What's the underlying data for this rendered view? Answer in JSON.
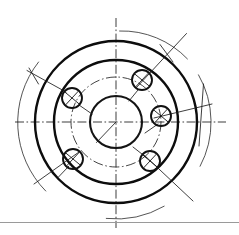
{
  "drawing": {
    "title": "Flange bolt-circle engineering drawing",
    "type": "orthographic-front-view",
    "background_color": "#ffffff",
    "line_color": "#111111",
    "thin_line_color": "#2a2a2a",
    "border_rule_color": "#9a9a9a",
    "canvas": {
      "width": 239,
      "height": 235
    },
    "center": {
      "x": 116,
      "y": 122
    },
    "features": {
      "outer_circle": {
        "name": "outer-rim-circle",
        "radius": 81,
        "line_weight": "thick"
      },
      "inner_circle": {
        "name": "inner-body-circle",
        "radius": 62,
        "line_weight": "thick"
      },
      "center_bore": {
        "name": "center-bore-circle",
        "radius": 26,
        "line_weight": "medium"
      },
      "bolt_circle": {
        "name": "bolt-circle",
        "radius": 45,
        "line_style": "dash-dot"
      },
      "hole_radius": 10,
      "hole_count": 5,
      "holes": [
        {
          "name": "hole-top",
          "angle_deg": -68,
          "cx": 142,
          "cy": 80
        },
        {
          "name": "hole-right",
          "angle_deg": -8,
          "cx": 161,
          "cy": 116
        },
        {
          "name": "hole-lower-right",
          "angle_deg": 58,
          "cx": 150,
          "cy": 161
        },
        {
          "name": "hole-lower-left",
          "angle_deg": 124,
          "cx": 73,
          "cy": 159
        },
        {
          "name": "hole-left",
          "angle_deg": 188,
          "cx": 72,
          "cy": 98
        }
      ],
      "center_lines": {
        "horizontal": {
          "name": "horizontal-center-line",
          "x1": 15,
          "x2": 226,
          "y": 122
        },
        "vertical": {
          "name": "vertical-center-line",
          "y1": 18,
          "y2": 228,
          "x": 116
        }
      },
      "dimension_arcs": [
        {
          "name": "dimension-arc-left",
          "radius": 98,
          "start_deg": 142,
          "end_deg": 225
        },
        {
          "name": "dimension-arc-top",
          "radius": 91,
          "start_deg": 272,
          "end_deg": 322
        },
        {
          "name": "dimension-arc-right",
          "radius": 95,
          "start_deg": 330,
          "end_deg": 28
        },
        {
          "name": "dimension-arc-bottom",
          "radius": 97,
          "start_deg": 60,
          "end_deg": 96
        }
      ],
      "leader_lines": [
        {
          "name": "leader-line-top-hole",
          "from": "hole-top",
          "direction": "upper-right"
        },
        {
          "name": "leader-line-right-hole",
          "from": "hole-right",
          "direction": "right"
        },
        {
          "name": "leader-line-lower-right-hole",
          "from": "hole-lower-right",
          "direction": "lower-right"
        },
        {
          "name": "leader-line-lower-left-hole",
          "from": "hole-lower-left",
          "direction": "lower-left"
        },
        {
          "name": "leader-line-left-hole",
          "from": "hole-left",
          "direction": "upper-left"
        },
        {
          "name": "leader-line-bore-radius",
          "from": "center-bore",
          "direction": "lower-left"
        }
      ],
      "border_rule": {
        "name": "page-border-rule",
        "y": 222
      }
    }
  }
}
